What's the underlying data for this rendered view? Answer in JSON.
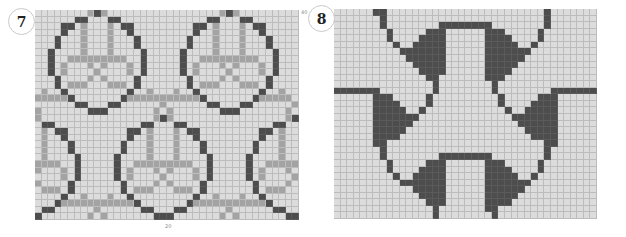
{
  "charts": [
    {
      "id": "chart-7",
      "badge_label": "7",
      "cols": 40,
      "rows": 32,
      "legend": {
        "light": "background",
        "M": "contrast color (mid gray)",
        "D": "main color (dark gray)"
      },
      "colors": {
        "light": "#dcdcdc",
        "M": "#a3a3a3",
        "D": "#4d4d4d",
        "grid": "#bcbcbc"
      },
      "tick_right_label": "40",
      "tick_bottom_label": "20",
      "motif": {
        "description": "circle with inner cross motif, 16 rows tall, centered on a column",
        "rows": [
          {
            "D": [
              0
            ],
            "M": [
              -1,
              1
            ]
          },
          {
            "D": [
              -3,
              -2,
              2,
              3
            ],
            "M": []
          },
          {
            "D": [
              -5,
              -4,
              4,
              5
            ],
            "M": [
              -2,
              2
            ]
          },
          {
            "D": [
              -5,
              5
            ],
            "M": [
              -2,
              2
            ]
          },
          {
            "D": [
              -6,
              6
            ],
            "M": [
              -2,
              2
            ]
          },
          {
            "D": [
              -6,
              6
            ],
            "M": [
              -2,
              2
            ]
          },
          {
            "D": [
              -7,
              7
            ],
            "M": [
              -2,
              2
            ]
          },
          {
            "D": [
              -7,
              7
            ],
            "M": [
              -4,
              -3,
              -2,
              -1,
              0,
              1,
              2,
              3,
              4
            ]
          },
          {
            "D": [
              -7,
              7
            ],
            "M": [
              -5,
              -1,
              1,
              5
            ]
          },
          {
            "D": [
              -7,
              7
            ],
            "M": [
              -5,
              0,
              5
            ]
          },
          {
            "D": [
              -6,
              6
            ],
            "M": [
              -1,
              1
            ]
          },
          {
            "D": [
              -6,
              6
            ],
            "M": [
              -4,
              -3,
              -2,
              2,
              3,
              4
            ]
          },
          {
            "D": [
              -5,
              5
            ],
            "M": [
              -8,
              8
            ]
          },
          {
            "D": [
              -4,
              4
            ],
            "M": [
              -10,
              -9,
              -8,
              -7,
              -6,
              -5,
              5,
              6,
              7,
              8,
              9
            ]
          },
          {
            "D": [
              -3,
              -2,
              2,
              3
            ],
            "M": [
              10
            ]
          },
          {
            "D": [
              -1,
              0,
              1
            ],
            "M": [
              -9,
              9
            ]
          }
        ]
      },
      "placements": [
        {
          "center_col": 9,
          "row_offset": 0
        },
        {
          "center_col": 29,
          "row_offset": 0
        },
        {
          "center_col": -1,
          "row_offset": 16
        },
        {
          "center_col": 19,
          "row_offset": 16
        },
        {
          "center_col": 39,
          "row_offset": 16
        }
      ]
    },
    {
      "id": "chart-8",
      "badge_label": "8",
      "cols": 40,
      "rows": 32,
      "colors": {
        "light": "#dcdcdc",
        "D": "#4d4d4d",
        "grid": "#bcbcbc"
      },
      "dark_runs": [
        [
          [
            6,
            7
          ],
          [
            32,
            32
          ]
        ],
        [
          [
            7,
            7
          ],
          [
            32,
            32
          ]
        ],
        [
          [
            7,
            7
          ],
          [
            16,
            23
          ],
          [
            32,
            32
          ]
        ],
        [
          [
            8,
            8
          ],
          [
            14,
            16
          ],
          [
            23,
            25
          ],
          [
            31,
            31
          ]
        ],
        [
          [
            8,
            8
          ],
          [
            13,
            16
          ],
          [
            23,
            26
          ],
          [
            31,
            31
          ]
        ],
        [
          [
            9,
            9
          ],
          [
            12,
            16
          ],
          [
            23,
            27
          ],
          [
            30,
            30
          ]
        ],
        [
          [
            10,
            16
          ],
          [
            23,
            29
          ]
        ],
        [
          [
            11,
            16
          ],
          [
            23,
            28
          ]
        ],
        [
          [
            12,
            16
          ],
          [
            23,
            27
          ]
        ],
        [
          [
            13,
            16
          ],
          [
            23,
            26
          ]
        ],
        [
          [
            14,
            15
          ],
          [
            23,
            25
          ]
        ],
        [
          [
            15,
            15
          ],
          [
            24,
            24
          ]
        ],
        [
          [
            0,
            6
          ],
          [
            15,
            15
          ],
          [
            24,
            24
          ],
          [
            33,
            39
          ]
        ],
        [
          [
            6,
            8
          ],
          [
            14,
            14
          ],
          [
            25,
            25
          ],
          [
            31,
            33
          ]
        ],
        [
          [
            6,
            9
          ],
          [
            14,
            14
          ],
          [
            25,
            25
          ],
          [
            30,
            33
          ]
        ],
        [
          [
            6,
            10
          ],
          [
            13,
            13
          ],
          [
            26,
            26
          ],
          [
            29,
            33
          ]
        ],
        [
          [
            6,
            12
          ],
          [
            27,
            33
          ]
        ],
        [
          [
            6,
            11
          ],
          [
            28,
            33
          ]
        ],
        [
          [
            6,
            10
          ],
          [
            29,
            33
          ]
        ],
        [
          [
            6,
            9
          ],
          [
            30,
            33
          ]
        ],
        [
          [
            6,
            7
          ],
          [
            32,
            33
          ]
        ],
        [
          [
            7,
            7
          ],
          [
            32,
            32
          ]
        ],
        [
          [
            7,
            7
          ],
          [
            16,
            23
          ],
          [
            32,
            32
          ]
        ],
        [
          [
            8,
            8
          ],
          [
            14,
            16
          ],
          [
            23,
            25
          ],
          [
            31,
            31
          ]
        ],
        [
          [
            8,
            8
          ],
          [
            13,
            16
          ],
          [
            23,
            26
          ],
          [
            31,
            31
          ]
        ],
        [
          [
            9,
            9
          ],
          [
            12,
            16
          ],
          [
            23,
            27
          ],
          [
            30,
            30
          ]
        ],
        [
          [
            10,
            16
          ],
          [
            23,
            29
          ]
        ],
        [
          [
            12,
            16
          ],
          [
            23,
            28
          ]
        ],
        [
          [
            13,
            16
          ],
          [
            23,
            27
          ]
        ],
        [
          [
            14,
            16
          ],
          [
            23,
            26
          ]
        ],
        [
          [
            15,
            15
          ],
          [
            23,
            24
          ]
        ],
        [
          [
            15,
            15
          ],
          [
            24,
            24
          ]
        ]
      ]
    }
  ]
}
